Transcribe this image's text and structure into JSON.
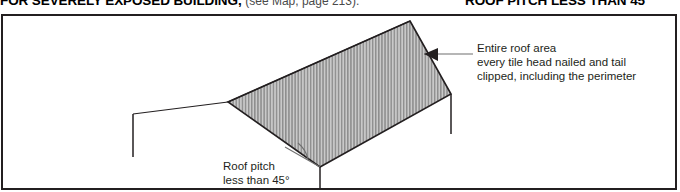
{
  "header": {
    "left_title": "FOR SEVERELY EXPOSED BUILDING,",
    "left_note": "(see Map, page 213).",
    "right_title": "ROOF PITCH LESS THAN 45°"
  },
  "figure": {
    "callouts": [
      {
        "name": "entire-roof-area",
        "lines": [
          "Entire roof area",
          "every tile head nailed and tail",
          "clipped, including the perimeter"
        ]
      },
      {
        "name": "roof-pitch",
        "lines": [
          "Roof pitch",
          "less than 45°"
        ]
      }
    ],
    "colors": {
      "line": "#231f20",
      "frame": "#231f20",
      "hatch_dark": "#8c8c8c",
      "hatch_light": "#c9c9c9",
      "leader": "#6f6f6f"
    },
    "diagram": {
      "type": "hipped-roof-isometric",
      "description": "Isometric view of a building roof drawn with vertical hatching, ridge apex at upper right, eaves descending to the left and to the lower centre, with short vertical wall lines at three corners and an angle arc marking the roof pitch."
    }
  }
}
